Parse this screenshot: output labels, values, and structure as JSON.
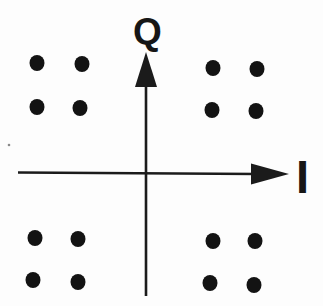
{
  "figure": {
    "background_color": "#fdfdfd",
    "ink_color": "#1b1b1b",
    "dot_color": "#131313",
    "x_axis_label": "I",
    "y_axis_label": "Q",
    "geometry": {
      "canvas": {
        "width": 323,
        "height": 306
      },
      "x_axis": {
        "y": 173,
        "x_start": 18,
        "x_tip": 289,
        "arrow_base_x": 251,
        "arrow_half_height": 10.5,
        "stroke_width": 2.6
      },
      "y_axis": {
        "x": 146,
        "y_tip": 52,
        "y_bottom": 296,
        "arrow_base_y": 87,
        "arrow_half_width": 11,
        "stroke_width": 2.6
      },
      "dot_rx": 7.5,
      "dot_ry": 8,
      "points_px": [
        {
          "x": 37,
          "y": 63
        },
        {
          "x": 82,
          "y": 64
        },
        {
          "x": 37,
          "y": 107
        },
        {
          "x": 80,
          "y": 108
        },
        {
          "x": 213,
          "y": 68
        },
        {
          "x": 257,
          "y": 69
        },
        {
          "x": 212,
          "y": 110
        },
        {
          "x": 256,
          "y": 111
        },
        {
          "x": 35,
          "y": 238
        },
        {
          "x": 78,
          "y": 239
        },
        {
          "x": 33,
          "y": 280
        },
        {
          "x": 78,
          "y": 282
        },
        {
          "x": 213,
          "y": 241
        },
        {
          "x": 255,
          "y": 241
        },
        {
          "x": 210,
          "y": 283
        },
        {
          "x": 254,
          "y": 285
        }
      ],
      "speck": {
        "x": 9,
        "y": 145,
        "r": 1.3,
        "color": "#8a8a8a"
      }
    }
  },
  "chart_data": {
    "type": "scatter",
    "title": "",
    "xlabel": "I",
    "ylabel": "Q",
    "grid": false,
    "legend": null,
    "axis_ticks_visible": false,
    "xlim": [
      -2.3,
      3.2
    ],
    "ylim": [
      -2.4,
      2.4
    ],
    "points": [
      {
        "i": -1.7,
        "q": 1.7
      },
      {
        "i": -1.0,
        "q": 1.7
      },
      {
        "i": -1.7,
        "q": 1.0
      },
      {
        "i": -1.0,
        "q": 1.0
      },
      {
        "i": 1.0,
        "q": 1.7
      },
      {
        "i": 1.7,
        "q": 1.7
      },
      {
        "i": 1.0,
        "q": 1.0
      },
      {
        "i": 1.7,
        "q": 1.0
      },
      {
        "i": -1.7,
        "q": -1.0
      },
      {
        "i": -1.0,
        "q": -1.0
      },
      {
        "i": -1.7,
        "q": -1.7
      },
      {
        "i": -1.0,
        "q": -1.7
      },
      {
        "i": 1.0,
        "q": -1.0
      },
      {
        "i": 1.7,
        "q": -1.0
      },
      {
        "i": 1.0,
        "q": -1.7
      },
      {
        "i": 1.7,
        "q": -1.7
      }
    ]
  }
}
